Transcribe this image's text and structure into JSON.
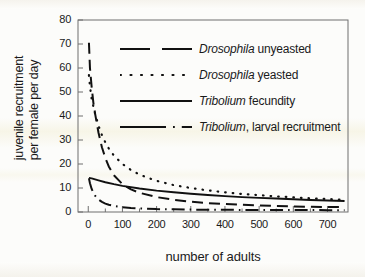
{
  "chart_data": {
    "type": "line",
    "title": "",
    "xlabel": "number of adults",
    "ylabel_line1": "juvenile recruitment",
    "ylabel_line2": "per female per day",
    "xlim": [
      -30,
      760
    ],
    "ylim": [
      0,
      80
    ],
    "xticks": [
      0,
      100,
      200,
      300,
      400,
      500,
      600,
      700
    ],
    "yticks": [
      0,
      10,
      20,
      30,
      40,
      50,
      60,
      70,
      80
    ],
    "xtick_labels": [
      "0",
      "100",
      "200",
      "300",
      "400",
      "500",
      "600",
      "700"
    ],
    "ytick_labels": [
      "0",
      "10",
      "20",
      "30",
      "40",
      "50",
      "60",
      "70",
      "80"
    ],
    "minor_xtick_step": 50,
    "grid": false,
    "legend_position": "upper right inside",
    "series": [
      {
        "name": "Drosophila unyeasted",
        "name_italic": "Drosophila",
        "name_rest": " unyeasted",
        "style": "dashed",
        "color": "#111111",
        "x": [
          2,
          5,
          10,
          15,
          20,
          30,
          40,
          50,
          60,
          75,
          100,
          125,
          150,
          200,
          250,
          300,
          350,
          400,
          450,
          500,
          550,
          600,
          650,
          700,
          750
        ],
        "y": [
          70.5,
          60.0,
          52.0,
          45.5,
          41.0,
          33.0,
          27.0,
          22.5,
          19.0,
          15.3,
          11.6,
          9.4,
          8.0,
          6.2,
          5.1,
          4.3,
          3.7,
          3.3,
          3.0,
          2.7,
          2.5,
          2.3,
          2.2,
          2.1,
          2.0
        ]
      },
      {
        "name": "Drosophila yeasted",
        "name_italic": "Drosophila",
        "name_rest": " yeasted",
        "style": "dotted",
        "color": "#111111",
        "x": [
          2,
          5,
          10,
          20,
          30,
          40,
          50,
          60,
          75,
          100,
          125,
          150,
          175,
          200,
          250,
          300,
          350,
          400,
          450,
          500,
          550,
          600,
          650,
          700,
          750
        ],
        "y": [
          57.0,
          52.5,
          47.0,
          41.0,
          36.0,
          32.0,
          29.0,
          26.5,
          23.5,
          20.0,
          17.5,
          15.6,
          14.2,
          13.0,
          11.2,
          10.0,
          9.0,
          8.2,
          7.5,
          7.0,
          6.5,
          6.1,
          5.7,
          5.4,
          5.1
        ]
      },
      {
        "name": "Tribolium fecundity",
        "name_italic": "Tribolium",
        "name_rest": " fecundity",
        "style": "solid",
        "color": "#111111",
        "x": [
          2,
          10,
          20,
          30,
          50,
          75,
          100,
          150,
          200,
          250,
          300,
          350,
          400,
          450,
          500,
          550,
          600,
          650,
          700,
          750
        ],
        "y": [
          14.2,
          14.0,
          13.6,
          13.2,
          12.4,
          11.6,
          10.9,
          9.8,
          8.9,
          8.2,
          7.6,
          7.1,
          6.6,
          6.2,
          5.9,
          5.6,
          5.3,
          5.0,
          4.8,
          4.6
        ]
      },
      {
        "name": "Tribolium, larval recruitment",
        "name_italic": "Tribolium",
        "name_rest": ", larval recruitment",
        "style": "dashdot",
        "color": "#111111",
        "x": [
          2,
          5,
          10,
          15,
          20,
          25,
          30,
          40,
          50,
          60,
          75,
          100,
          125,
          150,
          200,
          250,
          300,
          400,
          500,
          600,
          700,
          750
        ],
        "y": [
          14.0,
          12.0,
          9.6,
          8.0,
          6.8,
          5.9,
          5.2,
          4.2,
          3.5,
          3.0,
          2.5,
          2.0,
          1.7,
          1.5,
          1.2,
          1.1,
          1.0,
          0.9,
          0.85,
          0.8,
          0.78,
          0.75
        ]
      }
    ]
  },
  "axis": {
    "frame_color": "#6f6f6f"
  }
}
